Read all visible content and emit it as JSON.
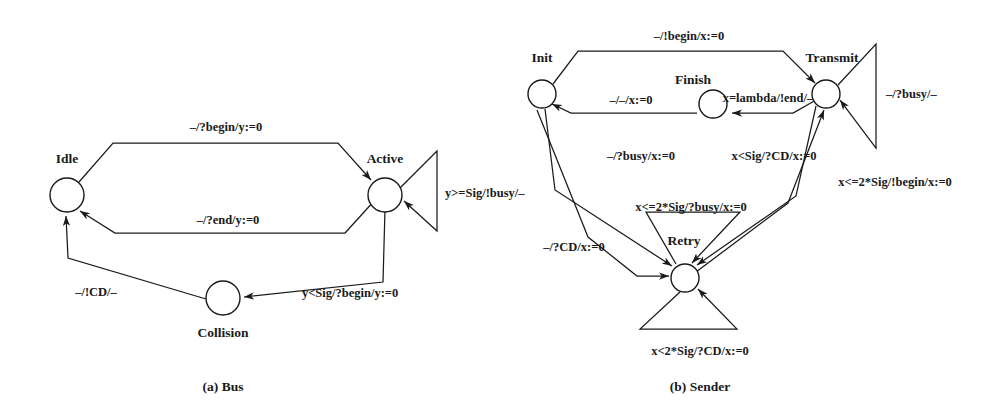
{
  "figure": {
    "background_color": "#ffffff",
    "ink_color": "#1a1a1a",
    "captions": [
      {
        "id": "caption-a",
        "text": "(a) Bus"
      },
      {
        "id": "caption-b",
        "text": "(b) Sender"
      }
    ]
  },
  "bus_automaton": {
    "title": "(a) Bus",
    "states": [
      {
        "id": "idle",
        "label": "Idle"
      },
      {
        "id": "active",
        "label": "Active"
      },
      {
        "id": "collision",
        "label": "Collision"
      }
    ],
    "transitions": [
      {
        "id": "idle-to-active",
        "from": "Idle",
        "to": "Active",
        "label": "–/?begin/y:=0"
      },
      {
        "id": "active-to-idle",
        "from": "Active",
        "to": "Idle",
        "label": "–/?end/y:=0"
      },
      {
        "id": "active-self",
        "from": "Active",
        "to": "Active",
        "label": "y>=Sig/!busy/–"
      },
      {
        "id": "active-to-collision",
        "from": "Active",
        "to": "Collision",
        "label": "y<Sig/?begin/y:=0"
      },
      {
        "id": "collision-to-idle",
        "from": "Collision",
        "to": "Idle",
        "label": "–/!CD/–"
      }
    ]
  },
  "sender_automaton": {
    "title": "(b) Sender",
    "states": [
      {
        "id": "init",
        "label": "Init"
      },
      {
        "id": "transmit",
        "label": "Transmit"
      },
      {
        "id": "finish",
        "label": "Finish"
      },
      {
        "id": "retry",
        "label": "Retry"
      }
    ],
    "transitions": [
      {
        "id": "init-to-transmit",
        "from": "Init",
        "to": "Transmit",
        "label": "–/!begin/x:=0"
      },
      {
        "id": "finish-to-init",
        "from": "Finish",
        "to": "Init",
        "label": "–/–/x:=0"
      },
      {
        "id": "transmit-to-finish",
        "from": "Transmit",
        "to": "Finish",
        "label": "x=lambda/!end/–"
      },
      {
        "id": "transmit-self",
        "from": "Transmit",
        "to": "Transmit",
        "label": "–/?busy/–"
      },
      {
        "id": "init-to-retry-busy",
        "from": "Init",
        "to": "Retry",
        "label": "–/?busy/x:=0"
      },
      {
        "id": "transmit-to-retry-cd",
        "from": "Transmit",
        "to": "Retry",
        "label": "x<Sig/?CD/x:=0"
      },
      {
        "id": "retry-to-transmit-begin",
        "from": "Retry",
        "to": "Transmit",
        "label": "x<=2*Sig/!begin/x:=0"
      },
      {
        "id": "retry-self-busy",
        "from": "Retry",
        "to": "Retry",
        "label": "x<=2*Sig/?busy/x:=0"
      },
      {
        "id": "init-to-retry-cd",
        "from": "Init",
        "to": "Retry",
        "label": "–/?CD/x:=0"
      },
      {
        "id": "retry-self-cd",
        "from": "Retry",
        "to": "Retry",
        "label": "x<2*Sig/?CD/x:=0"
      }
    ]
  }
}
